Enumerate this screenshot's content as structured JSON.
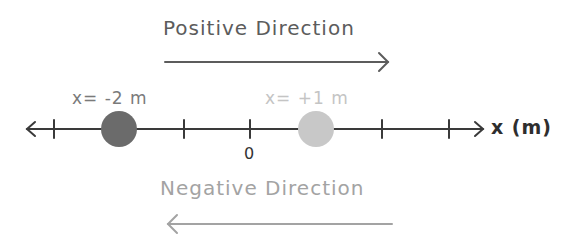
{
  "title_positive": "Positive Direction",
  "title_negative": "Negative Direction",
  "axis": {
    "label": "x (m)",
    "origin_label": "0"
  },
  "objects": [
    {
      "label": "x= -2 m",
      "position": -2,
      "color": "#6b6b6b"
    },
    {
      "label": "x= +1 m",
      "position": 1,
      "color": "#c8c8c8"
    }
  ],
  "colors": {
    "positive": "#5c5c5c",
    "negative": "#a3a3a3",
    "axis": "#3a3a3a"
  }
}
